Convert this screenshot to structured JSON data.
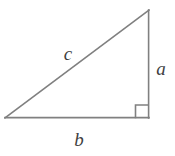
{
  "figure": {
    "name": "right-triangle",
    "background_color": "#ffffff",
    "stroke_color": "#808080",
    "label_color": "#3f3f3f",
    "stroke_width": 1.6,
    "canvas": {
      "width": 175,
      "height": 156
    },
    "vertices": {
      "left": {
        "x": 5,
        "y": 118
      },
      "bottom_right": {
        "x": 148,
        "y": 118
      },
      "top": {
        "x": 149,
        "y": 10
      }
    },
    "right_angle_marker": {
      "name": "right-angle-square",
      "size": 13,
      "corner": {
        "x": 148,
        "y": 118
      }
    },
    "labels": {
      "hypotenuse": "c",
      "vertical_leg": "a",
      "horizontal_leg": "b"
    },
    "label_positions": {
      "hypotenuse": {
        "x": 68,
        "y": 53
      },
      "vertical_leg": {
        "x": 161,
        "y": 68
      },
      "horizontal_leg": {
        "x": 79,
        "y": 139
      }
    }
  }
}
